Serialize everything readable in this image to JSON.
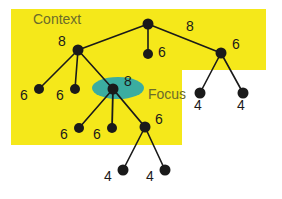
{
  "figure": {
    "type": "tree-diagram",
    "background": "#ffffff",
    "context_region_color": "#f5e81a",
    "focus_highlight_color": "#3bada0",
    "node_color": "#1a1a1a",
    "edge_color": "#1a1a1a",
    "label_color": "#1a1a1a",
    "region_label_color": "#6b6b2a"
  },
  "labels": {
    "context": "Context",
    "focus": "Focus"
  },
  "regions": [
    {
      "name": "context-region-upper",
      "x": 11,
      "y": 9,
      "width": 255,
      "height": 61
    },
    {
      "name": "context-region-lower",
      "x": 11,
      "y": 69,
      "width": 171,
      "height": 76
    }
  ],
  "focus_ellipse": {
    "cx": 118,
    "cy": 88,
    "rx": 26,
    "ry": 11
  },
  "nodes": [
    {
      "id": "root",
      "name": "node-root",
      "x": 148,
      "y": 24,
      "r": 5.5,
      "value": "",
      "label_dx": 0,
      "label_dy": 0
    },
    {
      "id": "n8a",
      "name": "node-8-left",
      "x": 78,
      "y": 50,
      "r": 5.5,
      "value": "8",
      "label_dx": -16,
      "label_dy": -4
    },
    {
      "id": "n6mid",
      "name": "node-6-center",
      "x": 148,
      "y": 54,
      "r": 5.0,
      "value": "6",
      "label_dx": 14,
      "label_dy": 3
    },
    {
      "id": "n6r",
      "name": "node-6-right",
      "x": 221,
      "y": 53,
      "r": 5.5,
      "value": "6",
      "label_dx": 15,
      "label_dy": -4
    },
    {
      "id": "l6a",
      "name": "leaf-6-far-left",
      "x": 39,
      "y": 89,
      "r": 5.0,
      "value": "6",
      "label_dx": -15,
      "label_dy": 11
    },
    {
      "id": "l6b",
      "name": "leaf-6-left",
      "x": 75,
      "y": 89,
      "r": 5.0,
      "value": "6",
      "label_dx": -15,
      "label_dy": 11
    },
    {
      "id": "focus",
      "name": "node-8-focus",
      "x": 113,
      "y": 89,
      "r": 5.5,
      "value": "8",
      "label_dx": 15,
      "label_dy": -3
    },
    {
      "id": "l6c",
      "name": "leaf-6-focus-a",
      "x": 79,
      "y": 128,
      "r": 5.0,
      "value": "6",
      "label_dx": -15,
      "label_dy": 11
    },
    {
      "id": "l6d",
      "name": "leaf-6-focus-b",
      "x": 112,
      "y": 128,
      "r": 5.0,
      "value": "6",
      "label_dx": -15,
      "label_dy": 11
    },
    {
      "id": "n6c",
      "name": "node-6-focus-c",
      "x": 145,
      "y": 127,
      "r": 5.5,
      "value": "6",
      "label_dx": 14,
      "label_dy": -3
    },
    {
      "id": "l4a",
      "name": "leaf-4-bottom-a",
      "x": 123,
      "y": 170,
      "r": 5.5,
      "value": "4",
      "label_dx": -15,
      "label_dy": 11
    },
    {
      "id": "l4b",
      "name": "leaf-4-bottom-b",
      "x": 165,
      "y": 170,
      "r": 5.5,
      "value": "4",
      "label_dx": -15,
      "label_dy": 11
    },
    {
      "id": "l4c",
      "name": "leaf-4-right-a",
      "x": 200,
      "y": 93,
      "r": 5.5,
      "value": "4",
      "label_dx": -2,
      "label_dy": 17
    },
    {
      "id": "l4d",
      "name": "leaf-4-right-b",
      "x": 243,
      "y": 93,
      "r": 5.5,
      "value": "4",
      "label_dx": -2,
      "label_dy": 17
    }
  ],
  "edges": [
    {
      "name": "edge-root-n8a",
      "from": "root",
      "to": "n8a",
      "w": 1.6
    },
    {
      "name": "edge-root-n6mid",
      "from": "root",
      "to": "n6mid",
      "w": 1.6
    },
    {
      "name": "edge-root-n6r",
      "from": "root",
      "to": "n6r",
      "w": 1.6
    },
    {
      "name": "edge-n8a-l6a",
      "from": "n8a",
      "to": "l6a",
      "w": 1.6
    },
    {
      "name": "edge-n8a-l6b",
      "from": "n8a",
      "to": "l6b",
      "w": 1.6
    },
    {
      "name": "edge-n8a-focus",
      "from": "n8a",
      "to": "focus",
      "w": 1.6
    },
    {
      "name": "edge-focus-l6c",
      "from": "focus",
      "to": "l6c",
      "w": 1.6
    },
    {
      "name": "edge-focus-l6d",
      "from": "focus",
      "to": "l6d",
      "w": 1.8
    },
    {
      "name": "edge-focus-n6c",
      "from": "focus",
      "to": "n6c",
      "w": 1.8
    },
    {
      "name": "edge-n6c-l4a",
      "from": "n6c",
      "to": "l4a",
      "w": 1.6
    },
    {
      "name": "edge-n6c-l4b",
      "from": "n6c",
      "to": "l4b",
      "w": 1.6
    },
    {
      "name": "edge-n6r-l4c",
      "from": "n6r",
      "to": "l4c",
      "w": 1.6
    },
    {
      "name": "edge-n6r-l4d",
      "from": "n6r",
      "to": "l4d",
      "w": 1.6
    }
  ],
  "edge_labels": [
    {
      "name": "edge-label-8",
      "text": "8",
      "x": 190,
      "y": 31
    }
  ],
  "region_labels": [
    {
      "name": "context-text",
      "text": "Context",
      "x": 33,
      "y": 24,
      "size": 14
    },
    {
      "name": "focus-text",
      "text": "Focus",
      "x": 148,
      "y": 99,
      "size": 14
    }
  ]
}
